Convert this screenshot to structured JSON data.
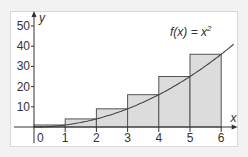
{
  "chart_data": {
    "type": "bar",
    "title": "",
    "function_label": "f(x) = x²",
    "function_label_parts": {
      "base": "f(x) = x",
      "exp": "2"
    },
    "xlabel": "x",
    "ylabel": "y",
    "origin_label": "0",
    "x_ticks": [
      "1",
      "2",
      "3",
      "4",
      "5",
      "6"
    ],
    "y_ticks": [
      "10",
      "20",
      "30",
      "40",
      "50"
    ],
    "xlim": [
      0,
      6.4
    ],
    "ylim": [
      0,
      52
    ],
    "categories": [
      "[0,1]",
      "[1,2]",
      "[2,3]",
      "[3,4]",
      "[4,5]",
      "[5,6]"
    ],
    "series": [
      {
        "name": "upper rectangles (right endpoint)",
        "x_left": [
          0,
          1,
          2,
          3,
          4,
          5
        ],
        "x_right": [
          1,
          2,
          3,
          4,
          5,
          6
        ],
        "values": [
          1,
          4,
          9,
          16,
          25,
          36
        ]
      },
      {
        "name": "f(x) = x^2",
        "type": "line",
        "x": [
          0,
          1,
          2,
          3,
          4,
          5,
          6,
          6.4
        ],
        "values": [
          0,
          1,
          4,
          9,
          16,
          25,
          36,
          40.96
        ]
      }
    ],
    "grid": false,
    "colors": {
      "bar_fill": "#dcdcdc",
      "bar_stroke": "#555555",
      "curve": "#444444",
      "axis": "#333333"
    }
  }
}
